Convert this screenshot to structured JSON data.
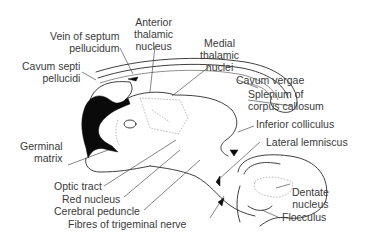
{
  "diagram": {
    "labels": {
      "vein_septum": [
        "Vein of septum",
        "pellucidum"
      ],
      "anterior_thalamic": [
        "Anterior",
        "thalamic",
        "nucleus"
      ],
      "medial_thalamic": [
        "Medial",
        "thalamic",
        "nuclei"
      ],
      "cavum_septi": [
        "Cavum septi",
        "pellucidi"
      ],
      "cavum_vergae": "Cavum vergae",
      "splenium": [
        "Splenium of",
        "corpus callosum"
      ],
      "inferior_colliculus": "Inferior colliculus",
      "lateral_lemniscus": "Lateral lemniscus",
      "germinal_matrix": [
        "Germinal",
        "matrix"
      ],
      "optic_tract": "Optic tract",
      "red_nucleus": "Red nucleus",
      "cerebral_peduncle": "Cerebral peduncle",
      "trigeminal_fibres": "Fibres of trigeminal nerve",
      "dentate_nucleus": [
        "Dentate",
        "nucleus"
      ],
      "flocculus": "Flocculus"
    },
    "colors": {
      "line": "#2a2a2a",
      "text": "#3a3a3a",
      "fill_black": "#0a0a0a",
      "dotted": "#9a9a9a",
      "background": "#ffffff"
    }
  }
}
